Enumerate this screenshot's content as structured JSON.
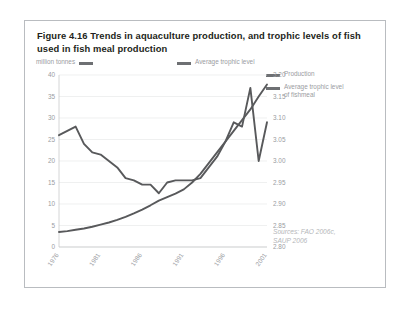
{
  "figure": {
    "title": "Figure 4.16 Trends in aquaculture production, and trophic levels of fish used in fish meal production",
    "sources": "Sources: FAO 2006c,\nSAUP 2006"
  },
  "legend": {
    "million_tonnes": "million tonnes",
    "average_trophic_level": "Average trophic level",
    "production": "Production",
    "average_trophic_level_fishmeal": "Average trophic level\nof fishmeal"
  },
  "chart_data": {
    "type": "line",
    "title": "Figure 4.16 Trends in aquaculture production, and trophic levels of fish used in fish meal production",
    "xlabel": "",
    "ylabel": "million tonnes",
    "y2label": "Average trophic level",
    "grid": true,
    "legend_position": "top",
    "x": [
      1976,
      1977,
      1978,
      1979,
      1980,
      1981,
      1982,
      1983,
      1984,
      1985,
      1986,
      1987,
      1988,
      1989,
      1990,
      1991,
      1992,
      1993,
      1994,
      1995,
      1996,
      1997,
      1998,
      1999,
      2000,
      2001
    ],
    "xticks": [
      1976,
      1981,
      1986,
      1991,
      1996,
      2001
    ],
    "xticklabels": [
      "1976",
      "1981",
      "1986",
      "1991",
      "1996",
      "2001"
    ],
    "ylim": [
      0,
      40
    ],
    "yticks": [
      0,
      5,
      10,
      15,
      20,
      25,
      30,
      35,
      40
    ],
    "yticklabels": [
      "0",
      "5",
      "10",
      "15",
      "20",
      "25",
      "30",
      "35",
      "40"
    ],
    "y2lim": [
      2.8,
      3.2
    ],
    "y2ticks": [
      2.8,
      2.85,
      2.9,
      2.95,
      3.0,
      3.05,
      3.1,
      3.15,
      3.2
    ],
    "y2ticklabels": [
      "2.80",
      "2.85",
      "2.90",
      "2.95",
      "3.00",
      "3.05",
      "3.10",
      "3.15",
      "3.20"
    ],
    "series": [
      {
        "name": "Production",
        "axis": "left",
        "units": "million tonnes",
        "color": "#58595b",
        "values": [
          3.5,
          3.7,
          4.0,
          4.3,
          4.7,
          5.2,
          5.7,
          6.3,
          7.0,
          7.8,
          8.7,
          9.7,
          10.8,
          11.6,
          12.4,
          13.4,
          15.0,
          17.0,
          19.5,
          22.0,
          24.5,
          27.0,
          29.5,
          32.0,
          35.0,
          37.8
        ]
      },
      {
        "name": "Average trophic level of fishmeal",
        "axis": "right",
        "units": "trophic level",
        "color": "#58595b",
        "values": [
          3.06,
          3.07,
          3.08,
          3.04,
          3.02,
          3.015,
          3.0,
          2.985,
          2.96,
          2.955,
          2.945,
          2.945,
          2.925,
          2.95,
          2.955,
          2.955,
          2.955,
          2.96,
          2.985,
          3.01,
          3.045,
          3.09,
          3.08,
          3.17,
          3.0,
          3.09
        ]
      }
    ]
  }
}
